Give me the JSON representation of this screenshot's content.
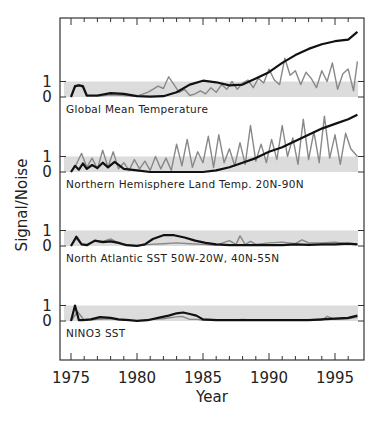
{
  "chart_data": {
    "type": "line",
    "xlabel": "Year",
    "ylabel": "Signal/Noise",
    "xlim": [
      1974.2,
      1997.2
    ],
    "x_ticks": [
      1975,
      1980,
      1985,
      1990,
      1995
    ],
    "x_tick_labels": [
      "1975",
      "1980",
      "1985",
      "1990",
      "1995"
    ],
    "minor_tick_interval": 1,
    "y_ticks_per_panel": [
      0,
      1
    ],
    "y_tick_labels": [
      "0",
      "1"
    ],
    "shaded_band": {
      "from": 0,
      "to": 1,
      "color": "#d9d9d9",
      "description": "noise band (S/N between 0 and 1)"
    },
    "colors": {
      "black_series": "#111111",
      "gray_series": "#888888",
      "band": "#dcdcdc",
      "axis": "#333333"
    },
    "panels": [
      {
        "label": "Global Mean Temperature",
        "black": {
          "x": [
            1975.0,
            1975.3,
            1975.6,
            1975.9,
            1976.2,
            1977,
            1978,
            1979,
            1980,
            1981,
            1982,
            1983,
            1984,
            1985,
            1986,
            1987,
            1988,
            1989,
            1990,
            1991,
            1992,
            1993,
            1994,
            1995,
            1996,
            1996.7
          ],
          "y": [
            0.0,
            0.7,
            0.75,
            0.7,
            0.1,
            0.1,
            0.25,
            0.2,
            0.05,
            0.02,
            0.05,
            0.3,
            0.8,
            1.05,
            0.95,
            0.75,
            0.8,
            1.2,
            1.6,
            2.2,
            2.7,
            3.1,
            3.4,
            3.6,
            3.7,
            4.2
          ]
        },
        "gray": {
          "x": [
            1975.0,
            1975.3,
            1975.6,
            1975.9,
            1976.2,
            1977,
            1978,
            1979,
            1980,
            1980.8,
            1981.2,
            1981.6,
            1982,
            1982.4,
            1982.8,
            1983.2,
            1983.6,
            1984,
            1984.4,
            1984.8,
            1985.2,
            1985.6,
            1986,
            1986.4,
            1986.8,
            1987.2,
            1987.6,
            1988,
            1988.4,
            1988.8,
            1989.2,
            1989.6,
            1990,
            1990.4,
            1990.8,
            1991.2,
            1991.6,
            1992,
            1992.4,
            1992.8,
            1993.2,
            1993.6,
            1994,
            1994.4,
            1994.8,
            1995.2,
            1995.6,
            1996,
            1996.4,
            1996.7
          ],
          "y": [
            0.0,
            0.6,
            0.8,
            0.6,
            0.05,
            0.05,
            0.15,
            0.1,
            0.05,
            0.3,
            0.5,
            0.7,
            0.55,
            1.3,
            0.8,
            0.3,
            0.5,
            0.1,
            0.2,
            0.4,
            0.2,
            0.6,
            0.3,
            0.8,
            0.5,
            1.0,
            0.5,
            0.9,
            1.1,
            0.6,
            1.2,
            0.9,
            1.8,
            1.1,
            0.8,
            2.5,
            1.4,
            1.7,
            0.8,
            1.6,
            1.2,
            0.6,
            1.7,
            1.0,
            2.2,
            0.5,
            1.5,
            1.8,
            0.4,
            2.3
          ]
        }
      },
      {
        "label": "Northern Hemisphere Land Temp. 20N-90N",
        "black": {
          "x": [
            1975.0,
            1975.3,
            1975.6,
            1975.9,
            1976.2,
            1976.6,
            1977,
            1977.4,
            1977.8,
            1978.3,
            1979,
            1980,
            1981,
            1982,
            1983,
            1984,
            1985,
            1986,
            1987,
            1988,
            1989,
            1990,
            1991,
            1992,
            1993,
            1994,
            1995,
            1996,
            1996.7
          ],
          "y": [
            0.0,
            0.4,
            0.15,
            0.55,
            0.2,
            0.45,
            0.25,
            0.6,
            0.3,
            0.65,
            0.2,
            0.1,
            0.0,
            0.0,
            0.0,
            0.0,
            0.0,
            0.1,
            0.3,
            0.6,
            0.9,
            1.3,
            1.6,
            2.0,
            2.4,
            2.8,
            3.1,
            3.4,
            3.7
          ]
        },
        "gray": {
          "x": [
            1975.0,
            1975.4,
            1975.8,
            1976.2,
            1976.6,
            1977.0,
            1977.4,
            1977.8,
            1978.2,
            1978.6,
            1979.0,
            1979.4,
            1979.8,
            1980.2,
            1980.6,
            1981.0,
            1981.4,
            1981.8,
            1982.2,
            1982.6,
            1983.0,
            1983.4,
            1983.8,
            1984.2,
            1984.6,
            1985.0,
            1985.4,
            1985.8,
            1986.2,
            1986.6,
            1987.0,
            1987.4,
            1987.8,
            1988.2,
            1988.6,
            1989.0,
            1989.4,
            1989.8,
            1990.2,
            1990.6,
            1991.0,
            1991.4,
            1991.8,
            1992.2,
            1992.6,
            1993.0,
            1993.4,
            1993.8,
            1994.2,
            1994.6,
            1995.0,
            1995.4,
            1995.8,
            1996.2,
            1996.7
          ],
          "y": [
            0.0,
            0.5,
            1.2,
            0.3,
            0.9,
            0.2,
            1.4,
            0.3,
            1.3,
            0.2,
            0.6,
            0.1,
            0.8,
            0.2,
            0.7,
            0.1,
            1.0,
            0.2,
            0.9,
            0.1,
            1.8,
            0.4,
            2.1,
            0.3,
            1.3,
            0.6,
            2.3,
            0.3,
            2.4,
            0.6,
            1.5,
            0.4,
            1.9,
            0.5,
            3.0,
            0.7,
            1.8,
            0.6,
            2.1,
            0.8,
            3.0,
            1.0,
            2.2,
            0.5,
            3.4,
            0.8,
            2.6,
            0.6,
            3.6,
            0.9,
            2.4,
            0.5,
            2.5,
            1.5,
            1.0
          ]
        }
      },
      {
        "label": "North Atlantic SST 50W-20W, 40N-55N",
        "black": {
          "x": [
            1975.0,
            1975.4,
            1975.8,
            1976.2,
            1976.8,
            1977.4,
            1978,
            1978.6,
            1979.2,
            1980,
            1980.6,
            1981.2,
            1982,
            1982.8,
            1983.6,
            1984.4,
            1985.2,
            1986,
            1987,
            1988,
            1989,
            1990,
            1991,
            1992,
            1993,
            1994,
            1995,
            1996,
            1996.7
          ],
          "y": [
            0.0,
            0.6,
            0.1,
            0.05,
            0.35,
            0.25,
            0.3,
            0.2,
            0.05,
            0.0,
            0.1,
            0.45,
            0.7,
            0.7,
            0.55,
            0.35,
            0.2,
            0.1,
            0.05,
            0.05,
            0.05,
            0.05,
            0.05,
            0.1,
            0.08,
            0.1,
            0.1,
            0.15,
            0.1
          ]
        },
        "gray": {
          "x": [
            1975.0,
            1975.4,
            1975.8,
            1976.2,
            1976.8,
            1977.4,
            1978,
            1978.6,
            1979.2,
            1980,
            1981,
            1982,
            1983,
            1984,
            1985,
            1986,
            1987,
            1987.5,
            1987.8,
            1988.2,
            1988.6,
            1989,
            1990,
            1991,
            1992,
            1992.5,
            1993,
            1994,
            1995,
            1996,
            1996.7
          ],
          "y": [
            0.0,
            0.5,
            0.1,
            0.1,
            0.3,
            0.3,
            0.45,
            0.2,
            0.1,
            0.05,
            0.1,
            0.15,
            0.2,
            0.15,
            0.1,
            0.05,
            0.35,
            0.1,
            0.65,
            0.1,
            0.3,
            0.1,
            0.2,
            0.25,
            0.15,
            0.4,
            0.2,
            0.2,
            0.25,
            0.15,
            0.1
          ]
        }
      },
      {
        "label": "NINO3 SST",
        "black": {
          "x": [
            1975.0,
            1975.3,
            1975.6,
            1975.9,
            1976.5,
            1977.2,
            1978,
            1978.6,
            1979.4,
            1980,
            1980.8,
            1981.6,
            1982.4,
            1983,
            1983.5,
            1984,
            1984.5,
            1985,
            1986,
            1987,
            1988,
            1989,
            1990,
            1991,
            1992,
            1993,
            1994,
            1995,
            1996,
            1996.7
          ],
          "y": [
            0.0,
            1.0,
            0.05,
            0.05,
            0.1,
            0.25,
            0.2,
            0.1,
            0.05,
            0.0,
            0.05,
            0.2,
            0.35,
            0.5,
            0.55,
            0.45,
            0.35,
            0.1,
            0.05,
            0.05,
            0.05,
            0.05,
            0.05,
            0.05,
            0.05,
            0.05,
            0.1,
            0.15,
            0.2,
            0.35
          ]
        },
        "gray": {
          "x": [
            1975.0,
            1975.5,
            1976,
            1977,
            1978,
            1979,
            1980,
            1981,
            1982,
            1982.8,
            1983.4,
            1984,
            1984.6,
            1985,
            1986,
            1987,
            1988,
            1989,
            1990,
            1991,
            1992,
            1993,
            1994,
            1994.4,
            1995,
            1996,
            1996.7
          ],
          "y": [
            0.0,
            0.6,
            0.05,
            0.1,
            0.15,
            0.05,
            0.05,
            0.1,
            0.15,
            0.25,
            0.3,
            0.1,
            0.1,
            0.05,
            0.05,
            0.05,
            0.1,
            0.05,
            0.05,
            0.05,
            0.05,
            0.05,
            0.05,
            0.3,
            0.1,
            0.15,
            0.25
          ]
        }
      }
    ]
  },
  "layout": {
    "frame": {
      "left": 60,
      "top": 18,
      "right": 364,
      "bottom": 360
    },
    "x_origin_year": 1975,
    "x_origin_px": 71,
    "px_per_year": 13.2,
    "panel_baselines_px": [
      97,
      172,
      246,
      321
    ],
    "px_per_unit": 15.5,
    "band_left_px": 64,
    "band_right_px": 358,
    "panel_label_offsets_px": [
      13,
      13,
      13,
      13
    ]
  }
}
